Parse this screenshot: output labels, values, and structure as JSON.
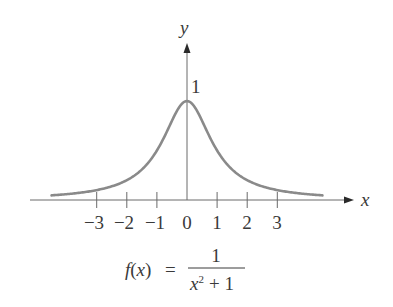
{
  "chart_data": {
    "type": "line",
    "title": "",
    "xlabel": "x",
    "ylabel": "y",
    "xlim": [
      -5.2,
      5.6
    ],
    "ylim": [
      0,
      1.6
    ],
    "grid": false,
    "legend": null,
    "x_ticks": [
      -3,
      -2,
      -1,
      0,
      1,
      2,
      3
    ],
    "x_tick_labels": [
      "−3",
      "−2",
      "−1",
      "0",
      "1",
      "2",
      "3"
    ],
    "y_ticks": [
      1
    ],
    "y_tick_labels": [
      "1"
    ],
    "series": [
      {
        "name": "f(x) = 1/(x^2 + 1)",
        "domain": [
          -4.5,
          4.5
        ],
        "x": [
          -4.5,
          -4,
          -3.5,
          -3,
          -2.5,
          -2,
          -1.5,
          -1,
          -0.5,
          0,
          0.5,
          1,
          1.5,
          2,
          2.5,
          3,
          3.5,
          4,
          4.5
        ],
        "values": [
          0.047,
          0.059,
          0.075,
          0.1,
          0.138,
          0.2,
          0.308,
          0.5,
          0.8,
          1.0,
          0.8,
          0.5,
          0.308,
          0.2,
          0.138,
          0.1,
          0.075,
          0.059,
          0.047
        ],
        "color": "#8a8a8a"
      }
    ],
    "annotations": [
      {
        "text": "1",
        "x": 0.2,
        "y": 1.08,
        "meaning": "y-value of peak"
      }
    ],
    "caption": {
      "lhs_func": "f",
      "lhs_open": "(",
      "lhs_var": "x",
      "lhs_close": ")",
      "equals": "=",
      "numerator": "1",
      "denominator_var": "x",
      "denominator_exp": "2",
      "denominator_rest": "+ 1"
    }
  },
  "colors": {
    "curve": "#8a8a8a",
    "axis": "#6a6a6a",
    "text": "#3a3a3a",
    "background": "#ffffff"
  }
}
